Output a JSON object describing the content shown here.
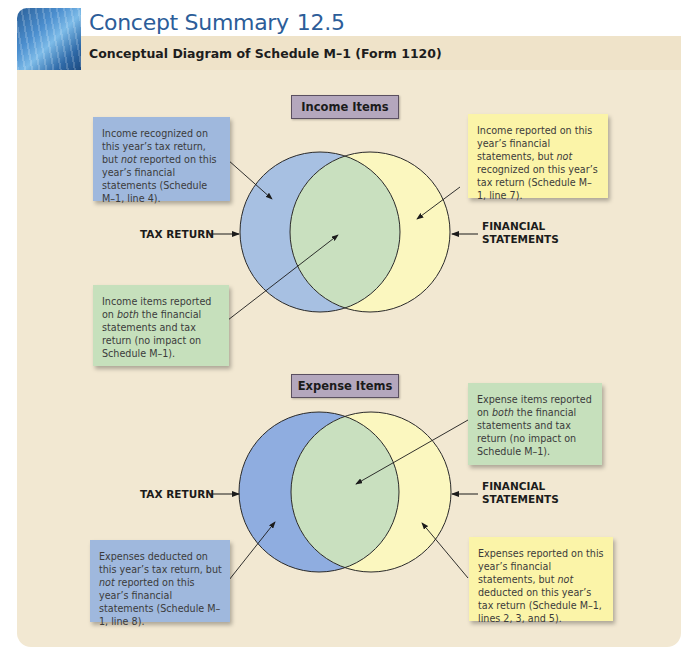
{
  "header": {
    "title": "Concept Summary",
    "number": "12.5",
    "subtitle": "Conceptual Diagram of Schedule M–1 (Form 1120)"
  },
  "colors": {
    "title_blue": "#2c5d99",
    "panel_bg": "#f2e8d2",
    "tax_return_circle": "#a7c0e2",
    "financial_statements_circle": "#fbf7bf",
    "overlap": "#c9e0bf",
    "label_box": "#b4a7bd"
  },
  "income": {
    "section_label": "Income Items",
    "left_label": "TAX RETURN",
    "right_label_line1": "FINANCIAL",
    "right_label_line2": "STATEMENTS",
    "notes": {
      "tax_only": {
        "pre": "Income recognized on this year’s tax return, but ",
        "em": "not",
        "post": " reported on this year’s financial statements (Schedule  M–1, line 4)."
      },
      "financial_only": {
        "pre": "Income reported on this year’s financial statements, but ",
        "em": "not",
        "post": " recognized on this year’s tax return (Schedule  M–1, line 7)."
      },
      "both": {
        "pre": "Income items reported on ",
        "em": "both",
        "post": " the financial statements and tax return (no impact on Schedule  M–1)."
      }
    }
  },
  "expense": {
    "section_label": "Expense Items",
    "left_label": "TAX RETURN",
    "right_label_line1": "FINANCIAL",
    "right_label_line2": "STATEMENTS",
    "notes": {
      "both": {
        "pre": "Expense items reported on ",
        "em": "both",
        "post": " the financial statements and tax return (no impact on Schedule  M–1)."
      },
      "tax_only": {
        "pre": "Expenses deducted on this year’s tax return, but ",
        "em": "not",
        "post": " reported on this year’s financial statements (Schedule M–1, line 8)."
      },
      "financial_only": {
        "pre": "Expenses reported on this year’s financial statements, but ",
        "em": "not",
        "post": " deducted on this year’s tax return (Schedule  M–1, lines 2, 3, and 5)."
      }
    }
  }
}
